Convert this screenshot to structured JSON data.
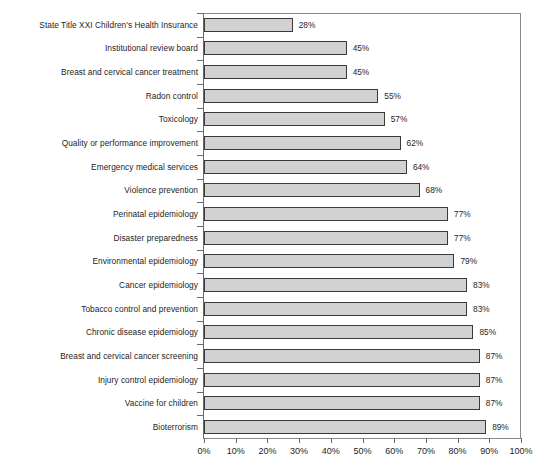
{
  "chart_data": {
    "type": "bar",
    "orientation": "horizontal",
    "title": "",
    "subtitle": "",
    "xlabel": "",
    "ylabel": "",
    "xlim": [
      0,
      100
    ],
    "xtick_labels": [
      "0%",
      "10%",
      "20%",
      "30%",
      "40%",
      "50%",
      "60%",
      "70%",
      "80%",
      "90%",
      "100%"
    ],
    "xtick_values": [
      0,
      10,
      20,
      30,
      40,
      50,
      60,
      70,
      80,
      90,
      100
    ],
    "grid": false,
    "legend": null,
    "value_label_suffix": "%",
    "categories": [
      "State Title XXI Children's Health Insurance",
      "Institutional review board",
      "Breast and cervical cancer treatment",
      "Radon control",
      "Toxicology",
      "Quality or performance improvement",
      "Emergency medical services",
      "Violence prevention",
      "Perinatal epidemiology",
      "Disaster preparedness",
      "Environmental epidemiology",
      "Cancer epidemiology",
      "Tobacco control and prevention",
      "Chronic disease epidemiology",
      "Breast and cervical cancer screening",
      "Injury control epidemiology",
      "Vaccine for children",
      "Bioterrorism"
    ],
    "values": [
      28,
      45,
      45,
      55,
      57,
      62,
      64,
      68,
      77,
      77,
      79,
      83,
      83,
      85,
      87,
      87,
      87,
      89
    ],
    "value_labels": [
      "28%",
      "45%",
      "45%",
      "55%",
      "57%",
      "62%",
      "64%",
      "68%",
      "77%",
      "77%",
      "79%",
      "83%",
      "83%",
      "85%",
      "87%",
      "87%",
      "87%",
      "89%"
    ],
    "colors": {
      "bar_fill": "#d2d2d2",
      "bar_stroke": "#3a3a3a",
      "axis": "#6a6a6a",
      "text": "#1d1d1d",
      "background": "#ffffff"
    }
  }
}
